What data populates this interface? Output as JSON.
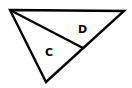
{
  "diagram": {
    "type": "geometry",
    "stroke_color": "#000000",
    "background": "#ffffff",
    "vertices": {
      "top_left": [
        10,
        10
      ],
      "top_right": [
        124,
        11
      ],
      "bottom": [
        46,
        82
      ],
      "junction_on_right_edge": [
        83,
        48
      ]
    },
    "regions": [
      {
        "label": "D",
        "x": 78,
        "y": 24
      },
      {
        "label": "C",
        "x": 45,
        "y": 47
      }
    ]
  }
}
